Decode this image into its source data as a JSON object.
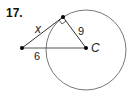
{
  "problem": {
    "number": "17."
  },
  "diagram": {
    "center_label": "C",
    "labels": {
      "tangent": "x",
      "radius": "9",
      "external_segment": "6"
    },
    "colors": {
      "stroke": "#222222",
      "circle": "#666666",
      "point": "#000000"
    }
  }
}
